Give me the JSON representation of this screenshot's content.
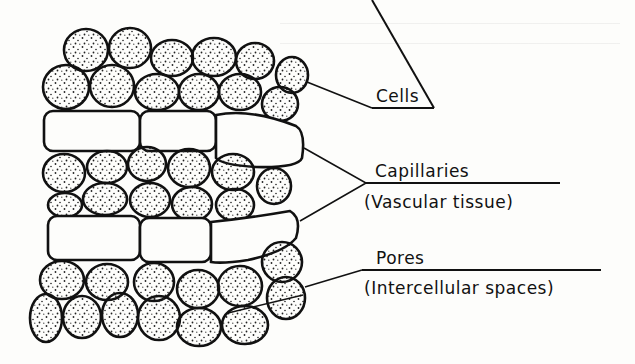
{
  "figure": {
    "labels": {
      "cells": "Cells",
      "capillaries": "Capillaries",
      "capillaries_sub": "(Vascular tissue)",
      "pores": "Pores",
      "pores_sub": "(Intercellular spaces)"
    },
    "colors": {
      "ink": "#111111",
      "paper": "#fdfdfb"
    }
  }
}
